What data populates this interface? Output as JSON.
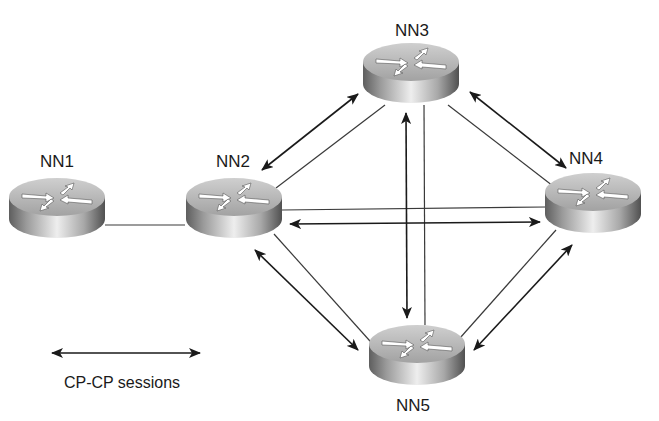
{
  "diagram": {
    "type": "network-topology",
    "nodes": [
      {
        "id": "NN1",
        "label": "NN1",
        "icon": "router-icon"
      },
      {
        "id": "NN2",
        "label": "NN2",
        "icon": "router-icon"
      },
      {
        "id": "NN3",
        "label": "NN3",
        "icon": "router-icon"
      },
      {
        "id": "NN4",
        "label": "NN4",
        "icon": "router-icon"
      },
      {
        "id": "NN5",
        "label": "NN5",
        "icon": "router-icon"
      }
    ],
    "links": [
      {
        "from": "NN1",
        "to": "NN2",
        "cp_cp_session": false
      },
      {
        "from": "NN2",
        "to": "NN3",
        "cp_cp_session": true
      },
      {
        "from": "NN2",
        "to": "NN4",
        "cp_cp_session": true
      },
      {
        "from": "NN2",
        "to": "NN5",
        "cp_cp_session": true
      },
      {
        "from": "NN3",
        "to": "NN4",
        "cp_cp_session": true
      },
      {
        "from": "NN3",
        "to": "NN5",
        "cp_cp_session": true
      },
      {
        "from": "NN4",
        "to": "NN5",
        "cp_cp_session": true
      }
    ],
    "legend": {
      "label": "CP-CP sessions",
      "symbol": "double-headed-arrow"
    }
  },
  "colors": {
    "line": "#3a3a3a",
    "arrow": "#1a1a1a",
    "router_top": "#b8b8b8",
    "router_body_light": "#e6e6e6",
    "router_body_dark": "#6a6a6a",
    "background": "#ffffff"
  }
}
